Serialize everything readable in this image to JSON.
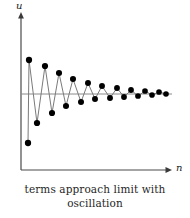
{
  "figure": {
    "caption_line1": "terms approach limit with",
    "caption_line2": "oscillation",
    "axis_color": "#4a4a4a",
    "point_color": "#000000",
    "line_color": "#7a7a7a",
    "limit_line_color": "#8a8a8a",
    "background": "#ffffff"
  },
  "axes": {
    "y_label": "u",
    "x_label": "n",
    "y_axis_x_px": 21,
    "y_axis_top_px": 14,
    "y_axis_bottom_px": 170,
    "x_axis_left_px": 21,
    "x_axis_right_px": 172,
    "x_axis_y_px": 170,
    "limit_line_y_px": 94,
    "limit_line_left_px": 21,
    "limit_line_right_px": 172
  },
  "chart_data": {
    "type": "scatter",
    "title": "",
    "subtitle": "",
    "xlabel": "n",
    "ylabel": "u",
    "annotations": [
      "terms approach limit with oscillation"
    ],
    "grid": false,
    "legend": "none",
    "xlim": [
      0,
      21
    ],
    "ylim": [
      -80,
      42
    ],
    "limit_value": 0,
    "x": [
      1,
      2,
      3,
      4,
      5,
      6,
      7,
      8,
      9,
      10,
      11,
      12,
      13,
      14,
      15,
      16,
      17,
      18,
      19,
      20
    ],
    "values": [
      -76,
      36,
      -50,
      28,
      -36,
      21,
      -26,
      15,
      -19,
      11,
      -14,
      8,
      -10,
      6,
      -7,
      4,
      -5,
      3,
      -3,
      2
    ],
    "series": [
      {
        "name": "u_n",
        "values": [
          -76,
          36,
          -50,
          28,
          -36,
          21,
          -26,
          15,
          -19,
          11,
          -14,
          8,
          -10,
          6,
          -7,
          4,
          -5,
          3,
          -3,
          2
        ]
      }
    ],
    "points_px": [
      {
        "x": 28,
        "y": 143
      },
      {
        "x": 29,
        "y": 60
      },
      {
        "x": 37,
        "y": 123
      },
      {
        "x": 45,
        "y": 66
      },
      {
        "x": 52,
        "y": 113
      },
      {
        "x": 59,
        "y": 73
      },
      {
        "x": 66,
        "y": 106
      },
      {
        "x": 73,
        "y": 79
      },
      {
        "x": 81,
        "y": 102
      },
      {
        "x": 88,
        "y": 83
      },
      {
        "x": 95,
        "y": 99
      },
      {
        "x": 102,
        "y": 86
      },
      {
        "x": 110,
        "y": 98
      },
      {
        "x": 117,
        "y": 88
      },
      {
        "x": 124,
        "y": 97
      },
      {
        "x": 131,
        "y": 90
      },
      {
        "x": 138,
        "y": 96
      },
      {
        "x": 145,
        "y": 91
      },
      {
        "x": 152,
        "y": 95
      },
      {
        "x": 159,
        "y": 92
      },
      {
        "x": 166,
        "y": 94
      }
    ]
  }
}
